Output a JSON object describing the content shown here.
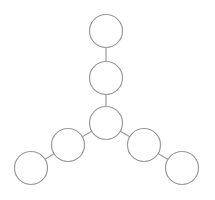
{
  "diagram": {
    "type": "tree",
    "background": "#ffffff",
    "stroke_color": "#9a9a9a",
    "node_radius": 16.5,
    "nodes": [
      {
        "id": "center",
        "cx": 106,
        "cy": 123
      },
      {
        "id": "up-1",
        "cx": 106,
        "cy": 78
      },
      {
        "id": "up-2",
        "cx": 106,
        "cy": 31
      },
      {
        "id": "left-1",
        "cx": 68,
        "cy": 145
      },
      {
        "id": "left-2",
        "cx": 31,
        "cy": 168
      },
      {
        "id": "right-1",
        "cx": 144,
        "cy": 145
      },
      {
        "id": "right-2",
        "cx": 182,
        "cy": 168
      }
    ],
    "edges": [
      [
        "center",
        "up-1"
      ],
      [
        "up-1",
        "up-2"
      ],
      [
        "center",
        "left-1"
      ],
      [
        "left-1",
        "left-2"
      ],
      [
        "center",
        "right-1"
      ],
      [
        "right-1",
        "right-2"
      ]
    ]
  }
}
